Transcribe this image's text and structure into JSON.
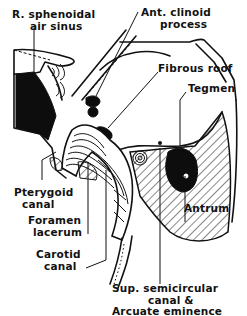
{
  "figure": {
    "colors": {
      "ink": "#111111",
      "background": "#ffffff",
      "solid_fill": "#0d0d0d"
    },
    "labels": {
      "sphenoidal_sinus_line1": "R. sphenoidal",
      "sphenoidal_sinus_line2": "air sinus",
      "ant_clinoid_line1": "Ant. clinoid",
      "ant_clinoid_line2": "process",
      "fibrous_roof": "Fibrous roof",
      "tegmen": "Tegmen",
      "pterygoid_line1": "Pterygoid",
      "pterygoid_line2": "canal",
      "foramen_line1": "Foramen",
      "foramen_line2": "lacerum",
      "carotid_line1": "Carotid",
      "carotid_line2": "canal",
      "antrum": "Antrum",
      "sup_canal_line1": "Sup. semicircular",
      "sup_canal_line2": "canal &",
      "sup_canal_line3": "Arcuate eminence"
    }
  }
}
